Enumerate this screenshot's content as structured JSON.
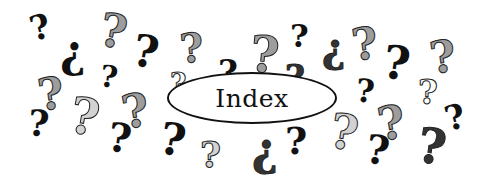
{
  "title": "Index",
  "colors": {
    "background": "#ffffff",
    "outline": "#111111",
    "black": "#111111",
    "dark": "#333333",
    "mid": "#9d9d9d",
    "light": "#d2d2d2"
  },
  "question_marks": [
    {
      "x": 30,
      "y": 10,
      "size": 34,
      "rot": -15,
      "tone": "black",
      "glyph": "?"
    },
    {
      "x": 60,
      "y": 30,
      "size": 44,
      "rot": 0,
      "tone": "black",
      "glyph": "¿"
    },
    {
      "x": 100,
      "y": 8,
      "size": 46,
      "rot": 10,
      "tone": "mid",
      "glyph": "?"
    },
    {
      "x": 133,
      "y": 30,
      "size": 44,
      "rot": 10,
      "tone": "black",
      "glyph": "?"
    },
    {
      "x": 100,
      "y": 62,
      "size": 30,
      "rot": 8,
      "tone": "black",
      "glyph": "?"
    },
    {
      "x": 38,
      "y": 72,
      "size": 44,
      "rot": -8,
      "tone": "mid",
      "glyph": "?"
    },
    {
      "x": 28,
      "y": 105,
      "size": 36,
      "rot": 5,
      "tone": "black",
      "glyph": "?"
    },
    {
      "x": 70,
      "y": 92,
      "size": 50,
      "rot": 10,
      "tone": "light",
      "glyph": "?"
    },
    {
      "x": 122,
      "y": 88,
      "size": 46,
      "rot": -10,
      "tone": "mid",
      "glyph": "?"
    },
    {
      "x": 108,
      "y": 118,
      "size": 40,
      "rot": 8,
      "tone": "black",
      "glyph": "?"
    },
    {
      "x": 180,
      "y": 28,
      "size": 40,
      "rot": -5,
      "tone": "mid",
      "glyph": "?"
    },
    {
      "x": 170,
      "y": 70,
      "size": 28,
      "rot": 0,
      "tone": "white",
      "glyph": "?"
    },
    {
      "x": 218,
      "y": 55,
      "size": 34,
      "rot": 0,
      "tone": "black",
      "glyph": "?"
    },
    {
      "x": 250,
      "y": 30,
      "size": 50,
      "rot": 5,
      "tone": "mid",
      "glyph": "?"
    },
    {
      "x": 290,
      "y": 20,
      "size": 32,
      "rot": 0,
      "tone": "black",
      "glyph": "?"
    },
    {
      "x": 285,
      "y": 60,
      "size": 34,
      "rot": 0,
      "tone": "dark",
      "glyph": "?"
    },
    {
      "x": 160,
      "y": 118,
      "size": 44,
      "rot": 10,
      "tone": "black",
      "glyph": "?"
    },
    {
      "x": 200,
      "y": 136,
      "size": 36,
      "rot": 0,
      "tone": "light",
      "glyph": "?"
    },
    {
      "x": 252,
      "y": 128,
      "size": 44,
      "rot": 0,
      "tone": "dark",
      "glyph": "¿"
    },
    {
      "x": 285,
      "y": 122,
      "size": 38,
      "rot": 0,
      "tone": "black",
      "glyph": "?"
    },
    {
      "x": 322,
      "y": 28,
      "size": 40,
      "rot": 0,
      "tone": "dark",
      "glyph": "¿"
    },
    {
      "x": 352,
      "y": 22,
      "size": 44,
      "rot": -8,
      "tone": "mid",
      "glyph": "?"
    },
    {
      "x": 383,
      "y": 40,
      "size": 46,
      "rot": 8,
      "tone": "black",
      "glyph": "?"
    },
    {
      "x": 356,
      "y": 75,
      "size": 32,
      "rot": 5,
      "tone": "black",
      "glyph": "?"
    },
    {
      "x": 430,
      "y": 35,
      "size": 44,
      "rot": -8,
      "tone": "mid",
      "glyph": "?"
    },
    {
      "x": 418,
      "y": 75,
      "size": 34,
      "rot": 0,
      "tone": "white",
      "glyph": "?"
    },
    {
      "x": 445,
      "y": 100,
      "size": 34,
      "rot": -15,
      "tone": "black",
      "glyph": "?"
    },
    {
      "x": 330,
      "y": 108,
      "size": 48,
      "rot": 10,
      "tone": "light",
      "glyph": "?"
    },
    {
      "x": 378,
      "y": 100,
      "size": 46,
      "rot": -10,
      "tone": "mid",
      "glyph": "?"
    },
    {
      "x": 366,
      "y": 130,
      "size": 40,
      "rot": 8,
      "tone": "black",
      "glyph": "?"
    },
    {
      "x": 418,
      "y": 122,
      "size": 48,
      "rot": 8,
      "tone": "dark",
      "glyph": "?"
    },
    {
      "x": 300,
      "y": 88,
      "size": 24,
      "rot": 0,
      "tone": "mid",
      "glyph": "?"
    }
  ]
}
